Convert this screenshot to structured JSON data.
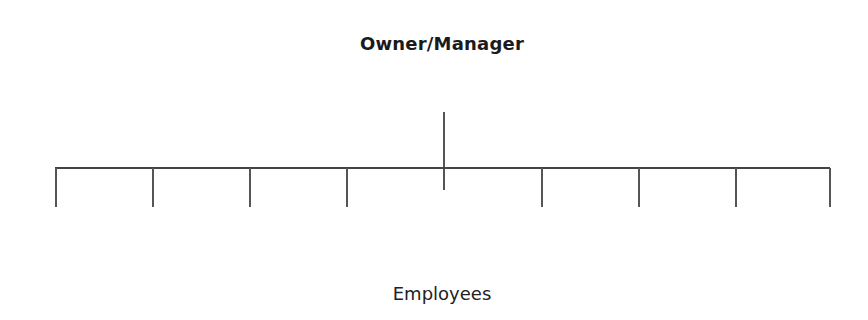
{
  "diagram": {
    "type": "org-chart",
    "top_node": {
      "label": "Owner/Manager"
    },
    "bottom_group": {
      "label": "Employees"
    },
    "employee_branches": 8,
    "line_color": "#555555"
  },
  "layout": {
    "stem": {
      "x": 444,
      "y1": 112,
      "y2": 190
    },
    "bar": {
      "y": 168,
      "x1": 55,
      "x2": 830
    },
    "drops": [
      {
        "x": 56,
        "y1": 168,
        "y2": 207
      },
      {
        "x": 153,
        "y1": 168,
        "y2": 207
      },
      {
        "x": 250,
        "y1": 168,
        "y2": 207
      },
      {
        "x": 347,
        "y1": 168,
        "y2": 207
      },
      {
        "x": 542,
        "y1": 168,
        "y2": 207
      },
      {
        "x": 639,
        "y1": 168,
        "y2": 207
      },
      {
        "x": 736,
        "y1": 168,
        "y2": 207
      },
      {
        "x": 830,
        "y1": 168,
        "y2": 207
      }
    ]
  }
}
